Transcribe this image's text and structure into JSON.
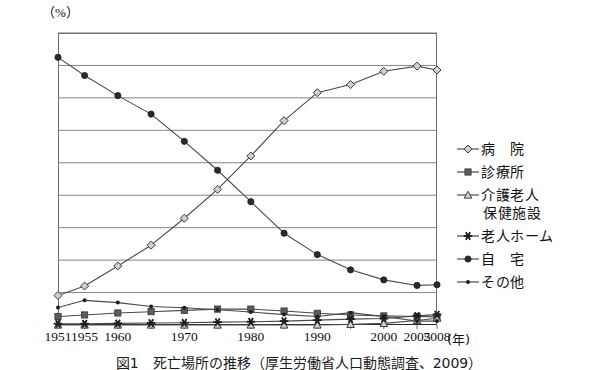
{
  "figure": {
    "caption": "図1　死亡場所の推移（厚生労働省人口動態調査、2009）",
    "y_unit": "（%）",
    "x_unit": "(年)"
  },
  "chart_data": {
    "type": "line",
    "title": "死亡場所の推移",
    "xlabel": "(年)",
    "ylabel": "（%）",
    "ylim": [
      0,
      90
    ],
    "ytick_labels": [
      "90.0",
      "50.0",
      "10.0",
      "0"
    ],
    "ytick_values": [
      90,
      50,
      10,
      0
    ],
    "gridlines": [
      10,
      20,
      30,
      40,
      50,
      60,
      70,
      80,
      90
    ],
    "grid": true,
    "legend_position": "right",
    "xlim": [
      1951,
      2008
    ],
    "xtick_labels": [
      "1951",
      "1955",
      "1960",
      "1970",
      "1980",
      "1990",
      "2000",
      "2005",
      "2008"
    ],
    "xtick_values": [
      1951,
      1955,
      1960,
      1970,
      1980,
      1990,
      2000,
      2005,
      2008
    ],
    "x": [
      1951,
      1955,
      1960,
      1965,
      1970,
      1975,
      1980,
      1985,
      1990,
      1995,
      2000,
      2005,
      2008
    ],
    "series": [
      {
        "name": "病　院",
        "marker": "diamond",
        "values": [
          9.1,
          12.0,
          18.2,
          24.6,
          32.9,
          41.8,
          52.1,
          63.0,
          71.6,
          74.1,
          78.2,
          79.8,
          78.6
        ]
      },
      {
        "name": "診療所",
        "marker": "square",
        "values": [
          2.6,
          3.1,
          3.7,
          4.1,
          4.5,
          4.9,
          4.9,
          4.3,
          3.6,
          3.1,
          2.8,
          2.6,
          2.5
        ]
      },
      {
        "name": "介護老人\n保健施設",
        "marker": "triangle",
        "values": [
          0,
          0,
          0,
          0,
          0,
          0,
          0,
          0,
          0,
          0.2,
          0.5,
          1.4,
          2.1
        ]
      },
      {
        "name": "老人ホーム",
        "marker": "star",
        "values": [
          0.4,
          0.4,
          0.5,
          0.6,
          0.7,
          0.9,
          1.0,
          1.2,
          1.5,
          1.8,
          2.0,
          2.8,
          3.2
        ]
      },
      {
        "name": "自　宅",
        "marker": "circle",
        "values": [
          82.5,
          76.9,
          70.7,
          65.0,
          56.6,
          47.7,
          38.0,
          28.3,
          21.7,
          17.0,
          13.9,
          12.2,
          12.4
        ]
      },
      {
        "name": "その他",
        "marker": "dot",
        "values": [
          5.4,
          7.6,
          6.9,
          5.7,
          5.3,
          4.7,
          4.0,
          3.2,
          2.6,
          3.8,
          2.6,
          1.2,
          1.2
        ]
      }
    ]
  },
  "legend": {
    "items": [
      {
        "label": "病　院",
        "marker": "diamond-marker"
      },
      {
        "label": "診療所",
        "marker": "square-marker"
      },
      {
        "label_line1": "介護老人",
        "label_line2": "保健施設",
        "marker": "triangle-marker"
      },
      {
        "label": "老人ホーム",
        "marker": "star-marker"
      },
      {
        "label": "自　宅",
        "marker": "filled-circle-marker"
      },
      {
        "label": "その他",
        "marker": "dot-marker"
      }
    ]
  },
  "colors": {
    "line": "#4a4a4a",
    "axis": "#5a5a5a",
    "grid": "#777777",
    "text": "#111111",
    "marker_fill_open": "#d9d9d9",
    "marker_fill_solid": "#2a2a2a"
  }
}
